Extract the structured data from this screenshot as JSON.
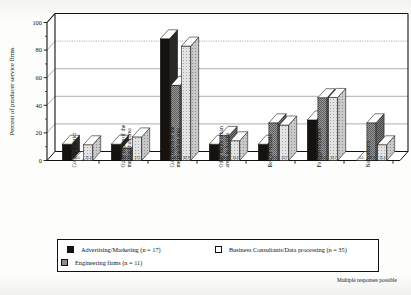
{
  "chart_data": {
    "type": "bar",
    "title": "",
    "subtitle": "",
    "xlabel": "",
    "ylabel": "Percent of producer service firms",
    "ylim": [
      0,
      100
    ],
    "yticks": [
      0,
      20,
      40,
      60,
      80,
      100
    ],
    "grid": true,
    "legend_position": "bottom",
    "orientation": "vertical-3d-grouped",
    "categories": [
      "County/District",
      "Outer region of the metropolitan area",
      "Core region of the metropolitan area",
      "Other major urban areas in Austria",
      "Rest of Austria",
      "Foreign countries",
      "No contacts"
    ],
    "series": [
      {
        "name": "Advertising/Marketing (n = 17)",
        "short_name": "Advertising/Marketing",
        "n": 17,
        "fill": "#15120f",
        "pattern": "solid-black",
        "values": [
          11.8,
          11.8,
          88.2,
          11.8,
          11.8,
          29.4,
          0.0
        ],
        "labels": [
          "11.8",
          "11.8",
          "88.2",
          "11.8",
          "11.8",
          "29.4",
          "0.0"
        ]
      },
      {
        "name": "Engineering firms (n = 11)",
        "short_name": "Engineering firms",
        "n": 11,
        "fill": "#8a8a8a",
        "pattern": "dense-hatch-grey",
        "values": [
          0.0,
          9.1,
          54.5,
          18.2,
          27.3,
          45.5,
          27.3
        ],
        "labels": [
          "0.0",
          "9.1",
          "54.5",
          "18.2",
          "27.3",
          "45.5",
          "27.3"
        ]
      },
      {
        "name": "Business Consultants/Data processing (n = 35)",
        "short_name": "Business Consultants/Data processing",
        "n": 35,
        "fill": "#d6d6d6",
        "pattern": "light-stipple",
        "values": [
          11.4,
          17.1,
          82.9,
          14.3,
          25.7,
          45.7,
          11.4
        ],
        "labels": [
          "11.4",
          "17.1",
          "82.9",
          "14.3",
          "25.7",
          "45.7",
          "11.4"
        ]
      }
    ],
    "footnote": "Multiple responses possible"
  },
  "legend": {
    "entries": [
      {
        "label": "Advertising/Marketing (n = 17)",
        "swatch": "#15120f"
      },
      {
        "label": "Business Consultants/Data processing (n = 35)",
        "swatch": "#ffffff"
      },
      {
        "label": "Engineering firms (n = 11)",
        "swatch": "#8a8a8a"
      }
    ]
  }
}
